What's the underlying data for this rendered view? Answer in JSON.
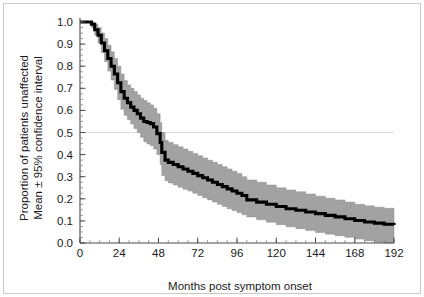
{
  "chart_data": {
    "type": "line",
    "title": "",
    "subtitle": "",
    "xlabel": "Months post symptom onset",
    "ylabel_line1": "Proportion of patients unaffected",
    "ylabel_line2": "Mean ± 95% confidence interval",
    "xlim": [
      0,
      192
    ],
    "ylim": [
      0,
      1.0
    ],
    "grid": false,
    "legend": "none",
    "reference_lines": [
      {
        "axis": "y",
        "value": 0.5,
        "color": "#d8d8d8",
        "label": ""
      }
    ],
    "x_ticks": [
      0,
      24,
      48,
      72,
      96,
      120,
      144,
      168,
      192
    ],
    "x_tick_labels": [
      "0",
      "24",
      "48",
      "72",
      "96",
      "120",
      "144",
      "168",
      "192"
    ],
    "x_minor_tick_interval": 6,
    "y_ticks": [
      0.0,
      0.1,
      0.2,
      0.3,
      0.4,
      0.5,
      0.6,
      0.7,
      0.8,
      0.9,
      1.0
    ],
    "y_tick_labels": [
      "0.0",
      "0.1",
      "0.2",
      "0.3",
      "0.4",
      "0.5",
      "0.6",
      "0.7",
      "0.8",
      "0.9",
      "1.0"
    ],
    "y_minor_tick_interval": 0.025,
    "median_survival_months": 46,
    "colors": {
      "mean_line": "#000000",
      "ci_band": "#a2a2a2",
      "ci_band_edge": "#7d7d7d",
      "axis": "#4a4a4a",
      "reference_line": "#d8d8d8",
      "frame": "#c9c9c9",
      "background": "#ffffff",
      "text": "#1a1a1a"
    },
    "series": [
      {
        "name": "Mean proportion unaffected",
        "x": [
          0,
          4,
          7,
          9,
          11,
          13,
          15,
          17,
          19,
          21,
          23,
          25,
          27,
          29,
          31,
          33,
          35,
          37,
          39,
          41,
          43,
          45,
          47,
          49,
          50,
          52,
          54,
          57,
          60,
          63,
          66,
          69,
          72,
          75,
          78,
          81,
          84,
          87,
          90,
          93,
          96,
          99,
          102,
          108,
          114,
          120,
          126,
          132,
          138,
          144,
          150,
          156,
          162,
          168,
          174,
          180,
          186,
          192
        ],
        "values": [
          1.0,
          1.0,
          0.99,
          0.965,
          0.94,
          0.905,
          0.87,
          0.835,
          0.8,
          0.765,
          0.725,
          0.685,
          0.655,
          0.635,
          0.615,
          0.6,
          0.585,
          0.565,
          0.55,
          0.545,
          0.54,
          0.525,
          0.495,
          0.455,
          0.41,
          0.375,
          0.365,
          0.355,
          0.345,
          0.335,
          0.325,
          0.315,
          0.305,
          0.295,
          0.285,
          0.275,
          0.265,
          0.255,
          0.245,
          0.235,
          0.225,
          0.215,
          0.195,
          0.185,
          0.175,
          0.165,
          0.155,
          0.148,
          0.14,
          0.133,
          0.125,
          0.118,
          0.11,
          0.102,
          0.095,
          0.09,
          0.085,
          0.082
        ]
      },
      {
        "name": "95% CI upper bound",
        "x": [
          0,
          4,
          7,
          9,
          11,
          13,
          15,
          17,
          19,
          21,
          23,
          25,
          27,
          29,
          31,
          33,
          35,
          37,
          39,
          41,
          43,
          45,
          47,
          49,
          50,
          52,
          54,
          57,
          60,
          63,
          66,
          69,
          72,
          75,
          78,
          81,
          84,
          87,
          90,
          93,
          96,
          99,
          102,
          108,
          114,
          120,
          126,
          132,
          138,
          144,
          150,
          156,
          162,
          168,
          174,
          180,
          186,
          192
        ],
        "values": [
          1.0,
          1.0,
          1.0,
          0.99,
          0.975,
          0.95,
          0.925,
          0.895,
          0.865,
          0.835,
          0.8,
          0.765,
          0.735,
          0.715,
          0.7,
          0.685,
          0.67,
          0.655,
          0.645,
          0.635,
          0.625,
          0.61,
          0.585,
          0.545,
          0.5,
          0.465,
          0.455,
          0.445,
          0.435,
          0.425,
          0.415,
          0.405,
          0.395,
          0.385,
          0.375,
          0.365,
          0.355,
          0.345,
          0.335,
          0.325,
          0.315,
          0.3,
          0.285,
          0.275,
          0.262,
          0.25,
          0.24,
          0.232,
          0.222,
          0.212,
          0.203,
          0.195,
          0.185,
          0.175,
          0.168,
          0.162,
          0.157,
          0.152
        ]
      },
      {
        "name": "95% CI lower bound",
        "x": [
          0,
          4,
          7,
          9,
          11,
          13,
          15,
          17,
          19,
          21,
          23,
          25,
          27,
          29,
          31,
          33,
          35,
          37,
          39,
          41,
          43,
          45,
          47,
          49,
          50,
          52,
          54,
          57,
          60,
          63,
          66,
          69,
          72,
          75,
          78,
          81,
          84,
          87,
          90,
          93,
          96,
          99,
          102,
          108,
          114,
          120,
          126,
          132,
          138,
          144,
          150,
          156,
          162,
          168,
          174,
          180,
          186,
          192
        ],
        "values": [
          1.0,
          1.0,
          0.975,
          0.94,
          0.905,
          0.862,
          0.82,
          0.778,
          0.738,
          0.695,
          0.648,
          0.605,
          0.578,
          0.558,
          0.538,
          0.518,
          0.5,
          0.478,
          0.458,
          0.448,
          0.44,
          0.425,
          0.4,
          0.355,
          0.305,
          0.282,
          0.272,
          0.262,
          0.252,
          0.243,
          0.235,
          0.225,
          0.215,
          0.205,
          0.195,
          0.185,
          0.175,
          0.165,
          0.155,
          0.147,
          0.138,
          0.128,
          0.118,
          0.105,
          0.094,
          0.083,
          0.073,
          0.065,
          0.056,
          0.048,
          0.04,
          0.033,
          0.026,
          0.018,
          0.01,
          0.003,
          0.0,
          0.0
        ]
      }
    ]
  }
}
